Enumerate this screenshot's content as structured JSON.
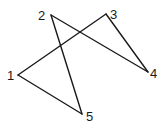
{
  "diagram": {
    "type": "polygon-path",
    "stroke_color": "#1a1a1a",
    "background": "#ffffff",
    "vertices": [
      {
        "id": "1",
        "label": "1",
        "x": 18,
        "y": 75,
        "label_x": 7,
        "label_y": 80
      },
      {
        "id": "2",
        "label": "2",
        "x": 51,
        "y": 15,
        "label_x": 38,
        "label_y": 20
      },
      {
        "id": "3",
        "label": "3",
        "x": 106,
        "y": 14,
        "label_x": 110,
        "label_y": 19
      },
      {
        "id": "4",
        "label": "4",
        "x": 148,
        "y": 72,
        "label_x": 150,
        "label_y": 78
      },
      {
        "id": "5",
        "label": "5",
        "x": 82,
        "y": 114,
        "label_x": 86,
        "label_y": 121
      }
    ],
    "edges": [
      {
        "from": "1",
        "to": "3"
      },
      {
        "from": "3",
        "to": "4"
      },
      {
        "from": "4",
        "to": "2"
      },
      {
        "from": "2",
        "to": "5"
      },
      {
        "from": "5",
        "to": "1"
      }
    ]
  }
}
